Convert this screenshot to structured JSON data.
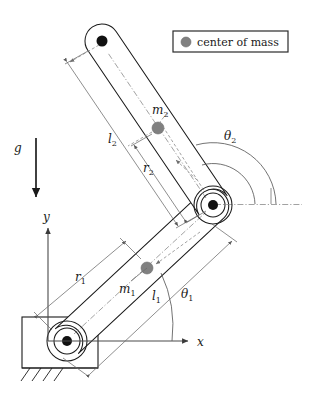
{
  "figure": {
    "width": 317,
    "height": 395,
    "background": "#ffffff"
  },
  "legend": {
    "label": "center of mass",
    "marker_color": "#808080",
    "marker_shape": "filled-circle",
    "box_stroke": "#2a2a2a"
  },
  "labels": {
    "gravity": "g",
    "axis_y": "y",
    "axis_x": "x",
    "theta1": "θ",
    "theta1_sub": "1",
    "theta2": "θ",
    "theta2_sub": "2",
    "m1": "m",
    "m1_sub": "1",
    "m2": "m",
    "m2_sub": "2",
    "l1": "l",
    "l1_sub": "1",
    "l2": "l",
    "l2_sub": "2",
    "r1": "r",
    "r1_sub": "1",
    "r2": "r",
    "r2_sub": "2"
  },
  "colors": {
    "ink": "#1a1a1a",
    "com": "#808080",
    "dimension": "#6a6a6a",
    "dashed": "#8a8a8a",
    "joint": "#111111"
  },
  "geometry": {
    "base_joint": {
      "x": 67,
      "y": 341,
      "label": "base-pivot"
    },
    "elbow_joint": {
      "x": 213,
      "y": 205,
      "label": "elbow-pivot"
    },
    "tip_joint": {
      "x": 102,
      "y": 41,
      "label": "link2-tip"
    },
    "com1": {
      "x": 147,
      "y": 268
    },
    "com2": {
      "x": 158,
      "y": 128
    },
    "origin": {
      "x": 48,
      "y": 341
    }
  }
}
